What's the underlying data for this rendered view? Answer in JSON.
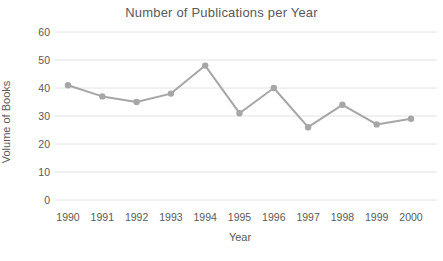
{
  "chart_data": {
    "type": "line",
    "title": "Number of Publications per Year",
    "xlabel": "Year",
    "ylabel": "Volume of Books",
    "categories": [
      "1990",
      "1991",
      "1992",
      "1993",
      "1994",
      "1995",
      "1996",
      "1997",
      "1998",
      "1999",
      "2000"
    ],
    "values": [
      41,
      37,
      35,
      38,
      48,
      31,
      40,
      26,
      34,
      27,
      29
    ],
    "ylim": [
      0,
      60
    ],
    "ytick_step": 10,
    "yticks": [
      0,
      10,
      20,
      30,
      40,
      50,
      60
    ],
    "grid": "horizontal",
    "legend": "none",
    "colors": {
      "line": "#a6a6a6",
      "marker": "#a6a6a6",
      "gridline": "#e2e2e2",
      "text": "#595959",
      "background": "#ffffff"
    }
  }
}
